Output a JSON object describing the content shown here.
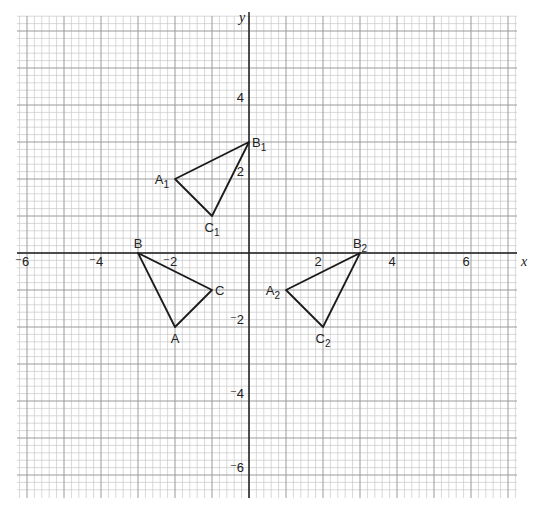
{
  "chart_data": {
    "type": "scatter",
    "subtype": "coordinate-grid-transformations",
    "title": "",
    "xlabel": "x",
    "ylabel": "y",
    "xlim": [
      -6.3,
      7.2
    ],
    "ylim": [
      -6.6,
      6.4
    ],
    "grid": true,
    "minor_grid_step": 0.2,
    "major_grid_step": 1,
    "x_ticks": [
      {
        "value": -6,
        "label": "⁻6"
      },
      {
        "value": -4,
        "label": "⁻4"
      },
      {
        "value": -2,
        "label": "⁻2"
      },
      {
        "value": 2,
        "label": "2"
      },
      {
        "value": 4,
        "label": "4"
      },
      {
        "value": 6,
        "label": "6"
      }
    ],
    "y_ticks": [
      {
        "value": 4,
        "label": "4"
      },
      {
        "value": 2,
        "label": "2"
      },
      {
        "value": -2,
        "label": "⁻2"
      },
      {
        "value": -4,
        "label": "⁻4"
      },
      {
        "value": -6,
        "label": "⁻6"
      }
    ],
    "shapes": [
      {
        "name": "ABC",
        "vertices": [
          {
            "label": "A",
            "sub": "",
            "x": -2,
            "y": -2,
            "label_pos": "below"
          },
          {
            "label": "B",
            "sub": "",
            "x": -3,
            "y": 0,
            "label_pos": "above"
          },
          {
            "label": "C",
            "sub": "",
            "x": -1,
            "y": -1,
            "label_pos": "right"
          }
        ]
      },
      {
        "name": "A1B1C1",
        "vertices": [
          {
            "label": "A",
            "sub": "1",
            "x": -2,
            "y": 2,
            "label_pos": "left"
          },
          {
            "label": "B",
            "sub": "1",
            "x": 0,
            "y": 3,
            "label_pos": "right"
          },
          {
            "label": "C",
            "sub": "1",
            "x": -1,
            "y": 1,
            "label_pos": "below"
          }
        ]
      },
      {
        "name": "A2B2C2",
        "vertices": [
          {
            "label": "A",
            "sub": "2",
            "x": 1,
            "y": -1,
            "label_pos": "left"
          },
          {
            "label": "B",
            "sub": "2",
            "x": 3,
            "y": 0,
            "label_pos": "above"
          },
          {
            "label": "C",
            "sub": "2",
            "x": 2,
            "y": -2,
            "label_pos": "below"
          }
        ]
      }
    ],
    "colors": {
      "minor_grid": "#c8c8c8",
      "major_grid": "#9a9a9a",
      "axis": "#222222",
      "shape_stroke": "#1a1a1a"
    }
  }
}
